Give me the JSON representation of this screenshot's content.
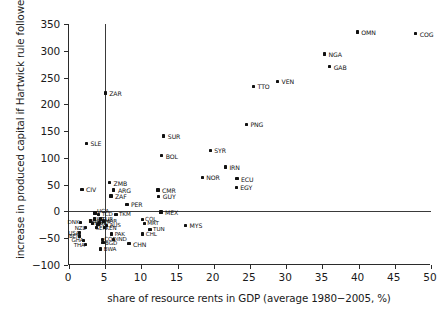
{
  "chart_data": {
    "type": "scatter",
    "title": "",
    "xlabel": "share of resource rents in GDP (average 1980−2005, %)",
    "ylabel": "increase in produced capital if Hartwick rule followed (%)",
    "xlim": [
      0,
      50
    ],
    "ylim": [
      -100,
      350
    ],
    "xticks": [
      0,
      5,
      10,
      15,
      20,
      25,
      30,
      35,
      40,
      45,
      50
    ],
    "yticks": [
      -100,
      -50,
      0,
      50,
      100,
      150,
      200,
      250,
      300,
      350
    ],
    "xticklabels": [
      "0",
      "5",
      "10",
      "15",
      "20",
      "25",
      "30",
      "35",
      "40",
      "45",
      "50"
    ],
    "yticklabels": [
      "−100",
      "−50",
      "0",
      "50",
      "100",
      "150",
      "200",
      "250",
      "300",
      "350"
    ],
    "grid": false,
    "legend": null,
    "reference_lines": [
      {
        "name": "vertical-reference-line",
        "orientation": "vertical",
        "x": 5,
        "y_from": -100,
        "y_to": 350
      },
      {
        "name": "horizontal-reference-line",
        "orientation": "horizontal",
        "y": 0,
        "x_from": 0,
        "x_to": 50
      }
    ],
    "point_label_field": "label",
    "points": [
      {
        "label": "COG",
        "x": 47.9,
        "y": 332,
        "lab_dx": 4,
        "lab_dy": -2,
        "big": true
      },
      {
        "label": "OMN",
        "x": 39.8,
        "y": 335,
        "lab_dx": 4,
        "lab_dy": -2,
        "big": true
      },
      {
        "label": "NGA",
        "x": 35.3,
        "y": 294,
        "lab_dx": 4,
        "lab_dy": -2,
        "big": true
      },
      {
        "label": "GAB",
        "x": 36.0,
        "y": 270,
        "lab_dx": 4,
        "lab_dy": -2,
        "big": true
      },
      {
        "label": "VEN",
        "x": 28.8,
        "y": 243,
        "lab_dx": 4,
        "lab_dy": -2,
        "big": true
      },
      {
        "label": "TTO",
        "x": 25.5,
        "y": 234,
        "lab_dx": 4,
        "lab_dy": -2,
        "big": true
      },
      {
        "label": "ZAR",
        "x": 5.0,
        "y": 221,
        "lab_dx": 4,
        "lab_dy": -2,
        "big": true
      },
      {
        "label": "PNG",
        "x": 24.5,
        "y": 163,
        "lab_dx": 4,
        "lab_dy": -2,
        "big": true
      },
      {
        "label": "SUR",
        "x": 13.1,
        "y": 141,
        "lab_dx": 4,
        "lab_dy": -2,
        "big": true
      },
      {
        "label": "SLE",
        "x": 2.4,
        "y": 127,
        "lab_dx": 4,
        "lab_dy": -2,
        "big": true
      },
      {
        "label": "SYR",
        "x": 19.5,
        "y": 114,
        "lab_dx": 4,
        "lab_dy": -2,
        "big": true
      },
      {
        "label": "BOL",
        "x": 12.8,
        "y": 104,
        "lab_dx": 4,
        "lab_dy": -2,
        "big": true
      },
      {
        "label": "IRN",
        "x": 21.6,
        "y": 83,
        "lab_dx": 4,
        "lab_dy": -2,
        "big": true
      },
      {
        "label": "NOR",
        "x": 18.4,
        "y": 64,
        "lab_dx": 4,
        "lab_dy": -2,
        "big": true
      },
      {
        "label": "ECU",
        "x": 23.2,
        "y": 61,
        "lab_dx": 4,
        "lab_dy": -2,
        "big": true
      },
      {
        "label": "ZMB",
        "x": 5.6,
        "y": 54,
        "lab_dx": 4,
        "lab_dy": -2,
        "big": true
      },
      {
        "label": "CIV",
        "x": 1.8,
        "y": 41,
        "lab_dx": 4,
        "lab_dy": -2,
        "big": true
      },
      {
        "label": "EGY",
        "x": 23.1,
        "y": 45,
        "lab_dx": 4,
        "lab_dy": -2,
        "big": true
      },
      {
        "label": "ARG",
        "x": 6.2,
        "y": 40,
        "lab_dx": 4,
        "lab_dy": -2,
        "big": true
      },
      {
        "label": "CMR",
        "x": 12.3,
        "y": 40,
        "lab_dx": 4,
        "lab_dy": -2,
        "big": true
      },
      {
        "label": "ZAF",
        "x": 5.8,
        "y": 29,
        "lab_dx": 4,
        "lab_dy": -2,
        "big": true
      },
      {
        "label": "GUY",
        "x": 12.4,
        "y": 28,
        "lab_dx": 4,
        "lab_dy": -2,
        "big": true
      },
      {
        "label": "PER",
        "x": 8.0,
        "y": 13,
        "lab_dx": 4,
        "lab_dy": -2,
        "big": true
      },
      {
        "label": "MEX",
        "x": 12.7,
        "y": -1,
        "lab_dx": 4,
        "lab_dy": -2,
        "big": true
      },
      {
        "label": "TCD",
        "x": 4.1,
        "y": -5,
        "lab_dx": 3,
        "lab_dy": -2,
        "big": false
      },
      {
        "label": "TKM",
        "x": 6.5,
        "y": -5,
        "lab_dx": 3,
        "lab_dy": -2,
        "big": false
      },
      {
        "label": "UGA",
        "x": 3.6,
        "y": -3,
        "lab_dx": 2,
        "lab_dy": -4,
        "big": false
      },
      {
        "label": "COL",
        "x": 10.1,
        "y": -15,
        "lab_dx": 3,
        "lab_dy": -2,
        "big": false
      },
      {
        "label": "MRT",
        "x": 10.4,
        "y": -22,
        "lab_dx": 3,
        "lab_dy": -2,
        "big": false
      },
      {
        "label": "MYS",
        "x": 16.1,
        "y": -26,
        "lab_dx": 4,
        "lab_dy": -2,
        "big": true
      },
      {
        "label": "TUN",
        "x": 11.2,
        "y": -33,
        "lab_dx": 3,
        "lab_dy": -2,
        "big": false
      },
      {
        "label": "CHL",
        "x": 10.2,
        "y": -42,
        "lab_dx": 3,
        "lab_dy": -2,
        "big": false
      },
      {
        "label": "CHN",
        "x": 8.3,
        "y": -60,
        "lab_dx": 4,
        "lab_dy": -2,
        "big": true
      },
      {
        "label": "DNK",
        "x": 1.6,
        "y": -20,
        "lab_dx": -13,
        "lab_dy": -2,
        "big": false
      },
      {
        "label": "NZL",
        "x": 2.3,
        "y": -30,
        "lab_dx": -11,
        "lab_dy": -2,
        "big": false
      },
      {
        "label": "USA",
        "x": 1.4,
        "y": -40,
        "lab_dx": -11,
        "lab_dy": -2,
        "big": false
      },
      {
        "label": "BEN",
        "x": 1.5,
        "y": -46,
        "lab_dx": -11,
        "lab_dy": -2,
        "big": false
      },
      {
        "label": "GHA",
        "x": 2.0,
        "y": -54,
        "lab_dx": -12,
        "lab_dy": -2,
        "big": false
      },
      {
        "label": "THA",
        "x": 2.3,
        "y": -62,
        "lab_dx": -12,
        "lab_dy": -2,
        "big": false
      },
      {
        "label": "PAK",
        "x": 5.9,
        "y": -42,
        "lab_dx": 3,
        "lab_dy": -2,
        "big": false
      },
      {
        "label": "COD",
        "x": 4.6,
        "y": -52,
        "lab_dx": 2,
        "lab_dy": -2,
        "big": false
      },
      {
        "label": "IND",
        "x": 6.2,
        "y": -52,
        "lab_dx": 3,
        "lab_dy": -2,
        "big": false
      },
      {
        "label": "BGD",
        "x": 4.7,
        "y": -58,
        "lab_dx": 2,
        "lab_dy": -2,
        "big": false
      },
      {
        "label": "BWA",
        "x": 4.4,
        "y": -70,
        "lab_dx": 3,
        "lab_dy": -2,
        "big": false
      },
      {
        "label": "AUS",
        "x": 5.2,
        "y": -26,
        "lab_dx": 3,
        "lab_dy": -2,
        "big": false
      },
      {
        "label": "BRA",
        "x": 4.0,
        "y": -24,
        "lab_dx": -2,
        "lab_dy": -2,
        "big": false
      },
      {
        "label": "ESP",
        "x": 3.5,
        "y": -14,
        "lab_dx": -1,
        "lab_dy": -2,
        "big": false
      },
      {
        "label": "TUR",
        "x": 4.4,
        "y": -14,
        "lab_dx": 1,
        "lab_dy": -2,
        "big": false
      },
      {
        "label": "KOR",
        "x": 3.0,
        "y": -18,
        "lab_dx": -2,
        "lab_dy": -2,
        "big": false
      },
      {
        "label": "PHL",
        "x": 3.3,
        "y": -22,
        "lab_dx": -2,
        "lab_dy": -2,
        "big": false
      },
      {
        "label": "NER",
        "x": 4.2,
        "y": -20,
        "lab_dx": 0,
        "lab_dy": -2,
        "big": false
      },
      {
        "label": "MAR",
        "x": 4.8,
        "y": -18,
        "lab_dx": 1,
        "lab_dy": -2,
        "big": false
      },
      {
        "label": "KEN",
        "x": 4.9,
        "y": -30,
        "lab_dx": 1,
        "lab_dy": -2,
        "big": false
      },
      {
        "label": "SEN",
        "x": 3.8,
        "y": -30,
        "lab_dx": -1,
        "lab_dy": -2,
        "big": false
      }
    ]
  }
}
